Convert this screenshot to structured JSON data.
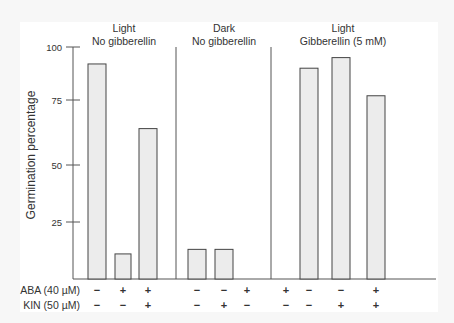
{
  "chart_data": {
    "type": "bar",
    "title": "",
    "ylabel": "Germination percentage",
    "xlabel": "",
    "ylim": [
      0,
      100
    ],
    "yticks": [
      25,
      50,
      75,
      100
    ],
    "grid": false,
    "groups": [
      {
        "header_line1": "Light",
        "header_line2": "No gibberellin",
        "conditions": [
          {
            "aba": "−",
            "kin": "−",
            "value": 92
          },
          {
            "aba": "+",
            "kin": "−",
            "value": 11
          },
          {
            "aba": "+",
            "kin": "+",
            "value": 64
          }
        ]
      },
      {
        "header_line1": "Dark",
        "header_line2": "No gibberellin",
        "conditions": [
          {
            "aba": "−",
            "kin": "−",
            "value": 13
          },
          {
            "aba": "−",
            "kin": "+",
            "value": 13
          },
          {
            "aba": "+",
            "kin": "−",
            "value": 0
          }
        ]
      },
      {
        "header_line1": "Light",
        "header_line2": "Gibberellin (5 mM)",
        "conditions": [
          {
            "aba": "+",
            "kin": "−",
            "value": 0
          },
          {
            "aba": "−",
            "kin": "−",
            "value": 90
          },
          {
            "aba": "−",
            "kin": "+",
            "value": 95
          },
          {
            "aba": "+",
            "kin": "+",
            "value": 77
          }
        ]
      }
    ],
    "row_labels": {
      "aba": "ABA (40 µM)",
      "kin": "KIN (50 µM)"
    },
    "bar_fill": "#ececec",
    "bar_stroke": "#444444"
  }
}
